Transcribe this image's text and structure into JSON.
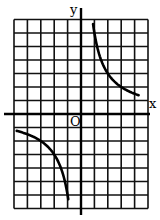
{
  "chart_data": {
    "type": "line",
    "title": "",
    "xlabel": "x",
    "ylabel": "y",
    "origin_label": "O",
    "function": "y = k/x (hyperbola, k > 0)",
    "k": 6,
    "xlim": [
      -5,
      5
    ],
    "ylim": [
      -7,
      7
    ],
    "grid": true,
    "grid_step": 1,
    "legend": null,
    "series": [
      {
        "name": "first-quadrant branch",
        "x": [
          0.9,
          1,
          1.5,
          2,
          3,
          4,
          4.3
        ],
        "y": [
          6.7,
          6,
          4,
          3,
          2,
          1.5,
          1.4
        ]
      },
      {
        "name": "third-quadrant branch",
        "x": [
          -4.8,
          -4,
          -3,
          -2,
          -1.5,
          -1,
          -0.95
        ],
        "y": [
          -1.25,
          -1.5,
          -2,
          -3,
          -4,
          -6,
          -6.3
        ]
      }
    ]
  },
  "labels": {
    "x_axis": "x",
    "y_axis": "y",
    "origin": "O"
  }
}
